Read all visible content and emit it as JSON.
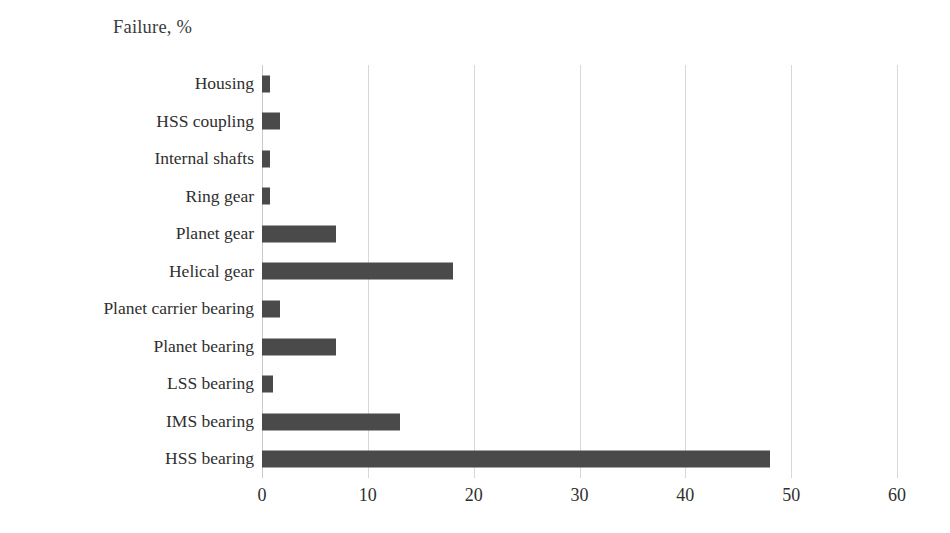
{
  "chart_data": {
    "type": "bar",
    "orientation": "horizontal",
    "title": "Failure, %",
    "xlabel": "",
    "ylabel": "",
    "xlim": [
      0,
      60
    ],
    "xticks": [
      0,
      10,
      20,
      30,
      40,
      50,
      60
    ],
    "xtick_labels": [
      "0",
      "10",
      "20",
      "30",
      "40",
      "50",
      "60"
    ],
    "grid": "vertical",
    "legend": "none",
    "bar_color": "#4a4a4a",
    "gridline_color": "#d8d8d8",
    "categories": [
      "Housing",
      "HSS coupling",
      "Internal shafts",
      "Ring gear",
      "Planet gear",
      "Helical gear",
      "Planet carrier bearing",
      "Planet bearing",
      "LSS bearing",
      "IMS bearing",
      "HSS bearing"
    ],
    "values": [
      0.8,
      1.7,
      0.8,
      0.8,
      7,
      18,
      1.7,
      7,
      1,
      13,
      48
    ],
    "series": [
      {
        "name": "Failure, %",
        "values": [
          0.8,
          1.7,
          0.8,
          0.8,
          7,
          18,
          1.7,
          7,
          1,
          13,
          48
        ]
      }
    ]
  }
}
